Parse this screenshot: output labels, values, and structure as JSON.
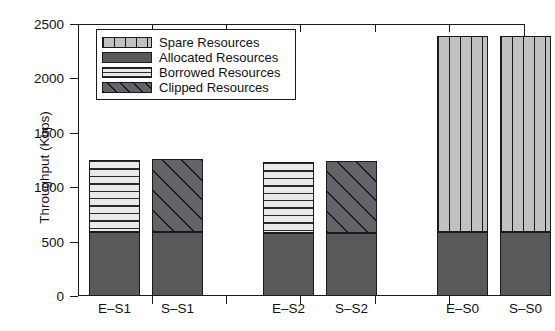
{
  "chart_data": {
    "type": "bar",
    "title": "",
    "subtitle": "",
    "xlabel": "",
    "ylabel": "Throughput (Kbps)",
    "categories": [
      "E–S1",
      "S–S1",
      "E–S2",
      "S–S2",
      "E–S0",
      "S–S0"
    ],
    "ylim": [
      0,
      2500
    ],
    "yticks": [
      0,
      500,
      1000,
      1500,
      2000,
      2500
    ],
    "ytick_labels": [
      "0",
      "500",
      "1000",
      "1500",
      "2000",
      "2500"
    ],
    "grid": false,
    "legend_position": "upper-left-inside",
    "stacked": true,
    "series": [
      {
        "name": "Allocated Resources",
        "key": "allocated",
        "color": "#59595b",
        "pattern": "solid",
        "values": [
          590,
          590,
          580,
          580,
          590,
          590
        ]
      },
      {
        "name": "Borrowed Resources",
        "key": "borrowed",
        "color": "#e9e9e9",
        "pattern": "horizontal-lines",
        "values": [
          660,
          0,
          650,
          0,
          0,
          0
        ]
      },
      {
        "name": "Clipped Resources",
        "key": "clipped",
        "color": "#63636a",
        "pattern": "diagonal-hatch",
        "values": [
          0,
          670,
          0,
          660,
          0,
          0
        ]
      },
      {
        "name": "Spare Resources",
        "key": "spare",
        "color": "#c0c0c0",
        "pattern": "vertical-lines",
        "values": [
          0,
          0,
          0,
          0,
          1800,
          1800
        ]
      }
    ],
    "bar_totals": [
      1250,
      1260,
      1230,
      1240,
      2390,
      2390
    ],
    "bars": [
      {
        "category": "E–S1",
        "total": 1250,
        "segments": [
          {
            "series": "Allocated Resources",
            "value": 590
          },
          {
            "series": "Borrowed Resources",
            "value": 660
          }
        ]
      },
      {
        "category": "S–S1",
        "total": 1260,
        "segments": [
          {
            "series": "Allocated Resources",
            "value": 590
          },
          {
            "series": "Clipped Resources",
            "value": 670
          }
        ]
      },
      {
        "category": "E–S2",
        "total": 1230,
        "segments": [
          {
            "series": "Allocated Resources",
            "value": 580
          },
          {
            "series": "Borrowed Resources",
            "value": 650
          }
        ]
      },
      {
        "category": "S–S2",
        "total": 1240,
        "segments": [
          {
            "series": "Allocated Resources",
            "value": 580
          },
          {
            "series": "Clipped Resources",
            "value": 660
          }
        ]
      },
      {
        "category": "E–S0",
        "total": 2390,
        "segments": [
          {
            "series": "Allocated Resources",
            "value": 590
          },
          {
            "series": "Spare Resources",
            "value": 1800
          }
        ]
      },
      {
        "category": "S–S0",
        "total": 2390,
        "segments": [
          {
            "series": "Allocated Resources",
            "value": 590
          },
          {
            "series": "Spare Resources",
            "value": 1800
          }
        ]
      }
    ]
  },
  "legend": {
    "entries": [
      {
        "label": "Spare Resources",
        "pattern": "vertical-lines"
      },
      {
        "label": "Allocated Resources",
        "pattern": "solid"
      },
      {
        "label": "Borrowed Resources",
        "pattern": "horizontal-lines"
      },
      {
        "label": "Clipped Resources",
        "pattern": "diagonal-hatch"
      }
    ]
  },
  "axes": {
    "y_title": "Throughput (Kbps)",
    "y_tick_labels": [
      "2500",
      "2000",
      "1500",
      "1000",
      "500",
      "0"
    ],
    "x_tick_labels": [
      "E–S1",
      "S–S1",
      "E–S2",
      "S–S2",
      "E–S0",
      "S–S0"
    ]
  }
}
